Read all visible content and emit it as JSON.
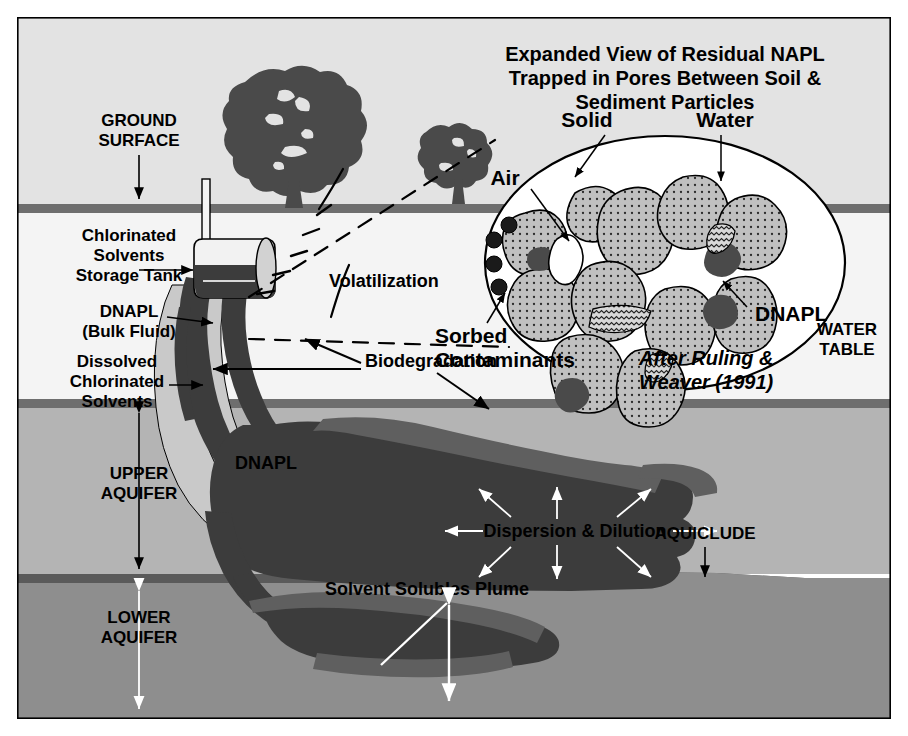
{
  "figure": {
    "kind": "cross-section-diagram"
  },
  "palette": {
    "page_background": "#ffffff",
    "vadose_zone": "#e3e3e3",
    "unsaturated_light": "#f2f2f2",
    "ground_surface_band": "#6e6e6e",
    "water_table_band": "#6e6e6e",
    "upper_aquifer": "#b4b4b4",
    "lower_aquifer": "#8e8e8e",
    "aquiclude_band": "#5a5a5a",
    "dnapl_dark": "#3c3c3c",
    "dnapl_mid": "#5f5f5f",
    "dissolved_light": "#c9c9c9",
    "tree": "#4a4a4a",
    "inset_fill": "#ffffff",
    "grain_fill": "#c0c0c0",
    "outline": "#000000",
    "white_text": "#ffffff",
    "black_text": "#000000"
  },
  "inset": {
    "title_lines": [
      "Expanded View of Residual NAPL",
      "Trapped in Pores Between Soil &",
      "Sediment Particles"
    ],
    "labels": {
      "solid": "Solid",
      "water": "Water",
      "air": "Air",
      "dnapl": "DNAPL",
      "sorbed_line1": "Sorbed",
      "sorbed_line2": "Contaminants"
    },
    "credit_lines": [
      "After Ruling &",
      "Weaver (1991)"
    ]
  },
  "labels": {
    "ground_surface_line1": "GROUND",
    "ground_surface_line2": "SURFACE",
    "tank_line1": "Chlorinated",
    "tank_line2": "Solvents",
    "tank_line3": "Storage Tank",
    "dnapl_bulk_line1": "DNAPL",
    "dnapl_bulk_line2": "(Bulk Fluid)",
    "dissolved_line1": "Dissolved",
    "dissolved_line2": "Chlorinated",
    "dissolved_line3": "Solvents",
    "volatilization": "Volatilization",
    "biodegradation": "Biodegradation",
    "upper_aquifer_line1": "UPPER",
    "upper_aquifer_line2": "AQUIFER",
    "lower_aquifer_line1": "LOWER",
    "lower_aquifer_line2": "AQUIFER",
    "dnapl_mass": "DNAPL",
    "dispersion": "Dispersion & Dilution",
    "solvent_plume": "Solvent Solubles Plume",
    "aquiclude": "AQUICLUDE",
    "water_table_line1": "WATER",
    "water_table_line2": "TABLE"
  }
}
